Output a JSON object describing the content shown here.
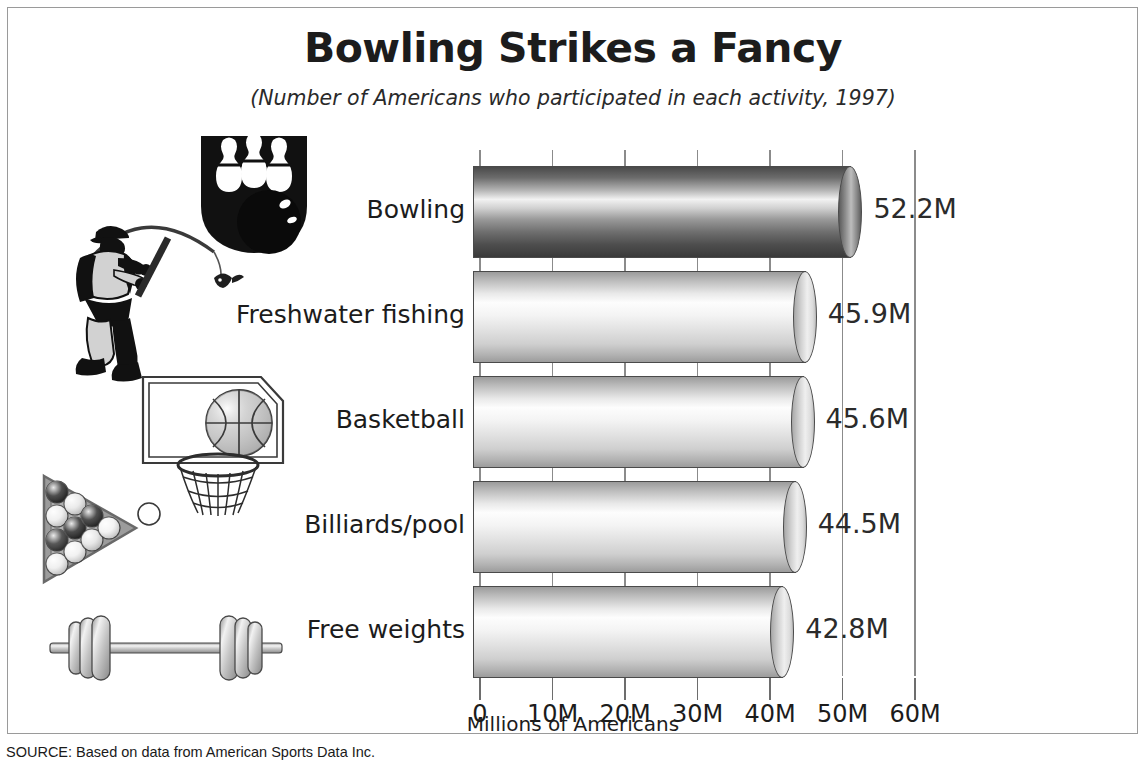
{
  "header": {
    "title": "Bowling Strikes a Fancy",
    "subtitle": "(Number of Americans who participated in each activity, 1997)"
  },
  "source": {
    "text": "SOURCE: Based on data from American Sports Data Inc."
  },
  "illustrations": [
    {
      "name": "bowling-pins-and-ball-illustration",
      "activity": "Bowling"
    },
    {
      "name": "fisherman-illustration",
      "activity": "Freshwater fishing"
    },
    {
      "name": "basketball-hoop-illustration",
      "activity": "Basketball"
    },
    {
      "name": "billiards-rack-illustration",
      "activity": "Billiards/pool"
    },
    {
      "name": "barbell-illustration",
      "activity": "Free weights"
    }
  ],
  "chart_data": {
    "type": "bar",
    "orientation": "horizontal",
    "title": "Bowling Strikes a Fancy",
    "subtitle": "(Number of Americans who participated in each activity, 1997)",
    "xlabel": "Millions of Americans",
    "ylabel": "",
    "xlim": [
      0,
      60
    ],
    "grid": true,
    "legend": "none",
    "units": "millions",
    "categories": [
      "Bowling",
      "Freshwater fishing",
      "Basketball",
      "Billiards/pool",
      "Free weights"
    ],
    "values": [
      52.2,
      45.9,
      45.6,
      44.5,
      42.8
    ],
    "value_labels": [
      "52.2M",
      "45.9M",
      "45.6M",
      "44.5M",
      "42.8M"
    ],
    "tick_values": [
      0,
      10,
      20,
      30,
      40,
      50,
      60
    ],
    "tick_labels": [
      "0",
      "10M",
      "20M",
      "30M",
      "40M",
      "50M",
      "60M"
    ],
    "bar_colors": [
      "#6a6a6a",
      "#d8d8d8",
      "#d8d8d8",
      "#d8d8d8",
      "#d8d8d8"
    ],
    "highlight_index": 0
  },
  "colors": {
    "frame": "#9a9a9a",
    "grid": "#8b8b8b",
    "text": "#1c1c1c",
    "bar_dark": "#6a6a6a",
    "bar_light": "#e6e6e6"
  }
}
